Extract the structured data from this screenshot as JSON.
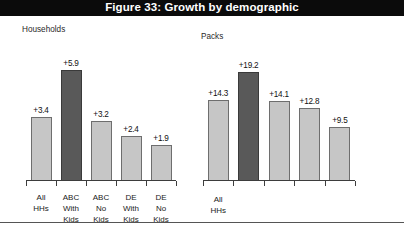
{
  "figure": {
    "title": "Figure 33: Growth by demographic",
    "title_bar_background": "#0b0b0b",
    "title_bar_color": "#ffffff",
    "footer_note": ""
  },
  "colors": {
    "bar_light": "#c6c6c6",
    "bar_dark": "#595959",
    "bar_border": "#6e6e6e",
    "axis": "#3d3d3d",
    "page_background": "#ffffff"
  },
  "panels": {
    "households": {
      "title": "Households"
    },
    "packs": {
      "title": "Packs"
    }
  },
  "chart_data": [
    {
      "type": "bar",
      "title": "Households",
      "xlabel": "",
      "ylabel": "",
      "ylim": [
        0,
        6.6
      ],
      "grid": false,
      "legend": "none",
      "categories": [
        "All HHs",
        "ABC With Kids",
        "ABC No Kids",
        "DE With Kids",
        "DE No Kids"
      ],
      "category_lines": [
        [
          "All",
          "HHs"
        ],
        [
          "ABC",
          "With",
          "Kids"
        ],
        [
          "ABC",
          "No",
          "Kids"
        ],
        [
          "DE",
          "With",
          "Kids"
        ],
        [
          "DE",
          "No",
          "Kids"
        ]
      ],
      "values": [
        3.4,
        5.9,
        3.2,
        2.4,
        1.9
      ],
      "labels": [
        "+3.4",
        "+5.9",
        "+3.2",
        "+2.4",
        "+1.9"
      ],
      "highlight_index": 1
    },
    {
      "type": "bar",
      "title": "Packs",
      "xlabel": "",
      "ylabel": "",
      "ylim": [
        0,
        21.5
      ],
      "grid": false,
      "legend": "none",
      "categories": [
        "All HHs",
        "",
        "",
        "",
        ""
      ],
      "category_lines": [
        [
          "All",
          "HHs"
        ],
        [],
        [],
        [],
        []
      ],
      "values": [
        14.3,
        19.2,
        14.1,
        12.8,
        9.5
      ],
      "labels": [
        "+14.3",
        "+19.2",
        "+14.1",
        "+12.8",
        "+9.5"
      ],
      "highlight_index": 1
    }
  ]
}
